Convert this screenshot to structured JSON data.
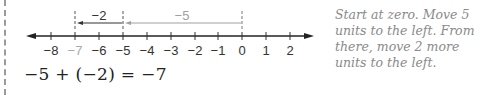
{
  "number_line": {
    "min": -8,
    "max": 2,
    "ticks": [
      {
        "value": -8,
        "label": "−8",
        "x": 51,
        "color": "#333333"
      },
      {
        "value": -7,
        "label": "−7",
        "x": 75,
        "color": "#aaaaaa"
      },
      {
        "value": -6,
        "label": "−6",
        "x": 99,
        "color": "#333333"
      },
      {
        "value": -5,
        "label": "−5",
        "x": 123,
        "color": "#333333"
      },
      {
        "value": -4,
        "label": "−4",
        "x": 147,
        "color": "#333333"
      },
      {
        "value": -3,
        "label": "−3",
        "x": 171,
        "color": "#333333"
      },
      {
        "value": -2,
        "label": "−2",
        "x": 195,
        "color": "#333333"
      },
      {
        "value": -1,
        "label": "−1",
        "x": 218,
        "color": "#333333"
      },
      {
        "value": 0,
        "label": "0",
        "x": 242,
        "color": "#333333"
      },
      {
        "value": 1,
        "label": "1",
        "x": 266,
        "color": "#333333"
      },
      {
        "value": 2,
        "label": "2",
        "x": 290,
        "color": "#333333"
      }
    ],
    "arrows": [
      {
        "label": "−5",
        "from": 0,
        "to": -5,
        "color": "#a0a0a0"
      },
      {
        "label": "−2",
        "from": -5,
        "to": -7,
        "color": "#333333"
      }
    ]
  },
  "equation": "−5 + (−2) = −7",
  "caption": "Start at zero. Move 5 units to the left. From there, move 2 more units to the left."
}
